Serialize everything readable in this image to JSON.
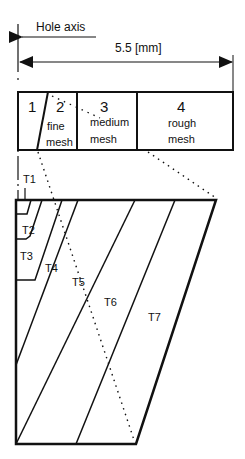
{
  "diagram": {
    "hole_axis_label": "Hole axis",
    "dimension_label": "5.5 [mm]",
    "zones": [
      {
        "number": "1",
        "line1": "",
        "line2": ""
      },
      {
        "number": "2",
        "line1": "fine",
        "line2": "mesh"
      },
      {
        "number": "3",
        "line1": "medium",
        "line2": "mesh"
      },
      {
        "number": "4",
        "line1": "rough",
        "line2": "mesh"
      }
    ],
    "regions": [
      "T1",
      "T2",
      "T3",
      "T4",
      "T5",
      "T6",
      "T7"
    ],
    "colors": {
      "stroke": "#111111",
      "background": "#ffffff"
    }
  }
}
